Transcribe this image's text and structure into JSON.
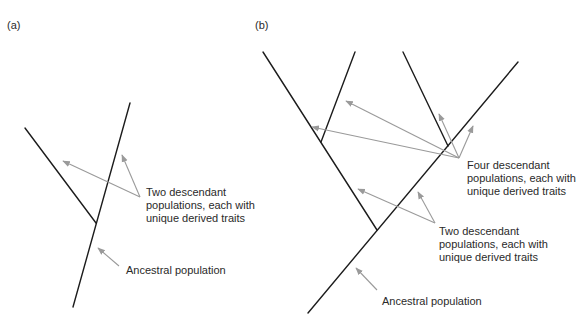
{
  "panels": [
    {
      "id": "a",
      "label": "(a)",
      "annotations": {
        "descendants": [
          "Two descendant",
          "populations, each with",
          "unique derived traits"
        ],
        "ancestral": "Ancestral population"
      }
    },
    {
      "id": "b",
      "label": "(b)",
      "annotations": {
        "four_descendants": [
          "Four descendant",
          "populations, each with",
          "unique derived traits"
        ],
        "two_descendants": [
          "Two descendant",
          "populations, each with",
          "unique derived traits"
        ],
        "ancestral": "Ancestral population"
      }
    }
  ],
  "colors": {
    "lineage": "#1c1c1c",
    "arrow": "#9a9a9a",
    "text": "#2a2a2a",
    "background": "#ffffff"
  }
}
